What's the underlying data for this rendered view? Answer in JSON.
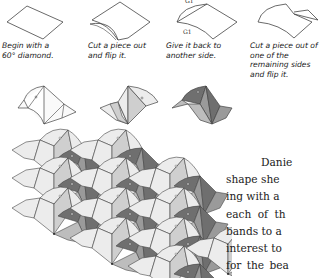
{
  "steps": [
    {
      "caption_lines": [
        "Begin with a",
        "60° diamond."
      ]
    },
    {
      "caption_lines": [
        "Cut a piece out",
        "and flip it."
      ]
    },
    {
      "caption_lines": [
        "Give it back to",
        "another side."
      ],
      "labels": [
        "G1",
        "G1"
      ]
    },
    {
      "caption_lines": [
        "Cut a piece out of",
        "one of the",
        "remaining sides",
        "and flip it."
      ]
    }
  ],
  "tile_variants": [
    "outline-tile",
    "shaded-tile",
    "dark-tile"
  ],
  "body_text": {
    "lines": [
      "Danie",
      "shape she",
      "ing with a",
      "each of th",
      "bands to a",
      "interest to",
      "for the bea"
    ]
  },
  "colors": {
    "light": "#ececec",
    "mid": "#bdbdbd",
    "midDark": "#9a9a9a",
    "dark": "#6f6f6f",
    "stroke": "#333333"
  }
}
